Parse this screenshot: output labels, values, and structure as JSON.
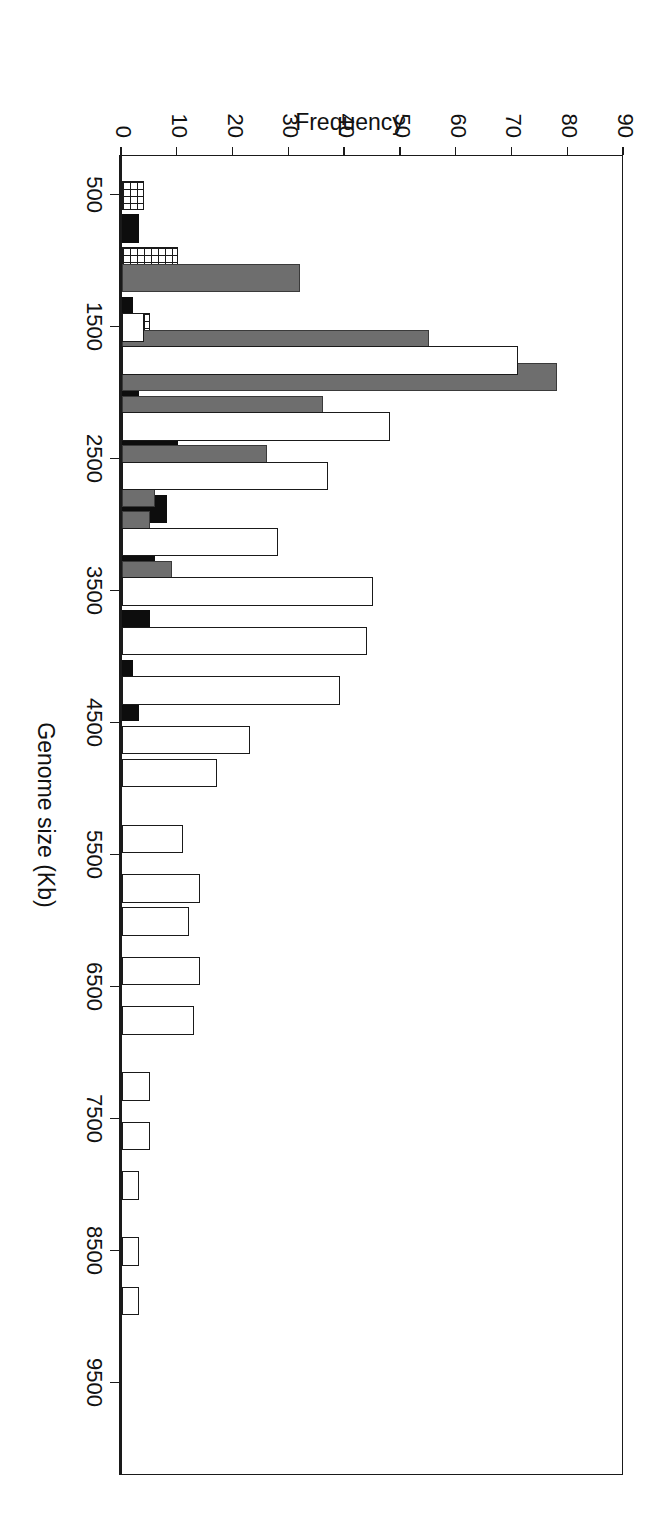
{
  "figure": {
    "background": "#ffffff",
    "frame_color": "#1a1a1a",
    "rotation_note": "page-rotated-90-degrees"
  },
  "chart_data": {
    "type": "bar",
    "title": "",
    "subtitle": "",
    "orientation": "vertical-grouped-histogram-rendered-rotated",
    "xlabel": "Genome size (Kb)",
    "ylabel": "Frequency",
    "xlim": [
      200,
      10200
    ],
    "ylim": [
      0,
      90
    ],
    "ytick_values": [
      0,
      10,
      20,
      30,
      40,
      50,
      60,
      70,
      80,
      90
    ],
    "ytick_labels": [
      "0",
      "10",
      "20",
      "30",
      "40",
      "50",
      "60",
      "70",
      "80",
      "90"
    ],
    "xtick_values": [
      500,
      1500,
      2500,
      3500,
      4500,
      5500,
      6500,
      7500,
      8500,
      9500
    ],
    "xtick_labels": [
      "500",
      "1500",
      "2500",
      "3500",
      "4500",
      "5500",
      "6500",
      "7500",
      "8500",
      "9500"
    ],
    "grid": false,
    "legend": false,
    "legend_position": "none",
    "bin_width": 250,
    "series_order": [
      "hatch",
      "black",
      "gray",
      "open"
    ],
    "series": [
      {
        "name": "crosshatch",
        "fill": "crosshatch",
        "color": "#ffffff",
        "edge": "#1a1a1a",
        "points": [
          {
            "x": 500,
            "y": 4
          },
          {
            "x": 1000,
            "y": 10
          },
          {
            "x": 1500,
            "y": 5
          },
          {
            "x": 1875,
            "y": 2
          }
        ]
      },
      {
        "name": "black",
        "fill": "solid",
        "color": "#0d0d0d",
        "edge": "#0d0d0d",
        "points": [
          {
            "x": 750,
            "y": 3
          },
          {
            "x": 1375,
            "y": 2
          },
          {
            "x": 2000,
            "y": 3
          },
          {
            "x": 2375,
            "y": 10
          },
          {
            "x": 2625,
            "y": 5
          },
          {
            "x": 2875,
            "y": 8
          },
          {
            "x": 3250,
            "y": 6
          },
          {
            "x": 3750,
            "y": 5
          },
          {
            "x": 4125,
            "y": 2
          },
          {
            "x": 4375,
            "y": 3
          }
        ]
      },
      {
        "name": "gray",
        "fill": "solid",
        "color": "#6e6e6e",
        "edge": "#3a3a3a",
        "points": [
          {
            "x": 1125,
            "y": 32
          },
          {
            "x": 1625,
            "y": 55
          },
          {
            "x": 1875,
            "y": 78
          },
          {
            "x": 2125,
            "y": 36
          },
          {
            "x": 2500,
            "y": 26
          },
          {
            "x": 2750,
            "y": 6
          },
          {
            "x": 3000,
            "y": 5
          },
          {
            "x": 3375,
            "y": 9
          },
          {
            "x": 3875,
            "y": 5
          },
          {
            "x": 4250,
            "y": 6
          },
          {
            "x": 4625,
            "y": 7
          },
          {
            "x": 4875,
            "y": 3
          }
        ]
      },
      {
        "name": "open",
        "fill": "none",
        "color": "#ffffff",
        "edge": "#1a1a1a",
        "points": [
          {
            "x": 1500,
            "y": 4
          },
          {
            "x": 1750,
            "y": 71
          },
          {
            "x": 2250,
            "y": 48
          },
          {
            "x": 2625,
            "y": 37
          },
          {
            "x": 3125,
            "y": 28
          },
          {
            "x": 3500,
            "y": 45
          },
          {
            "x": 3875,
            "y": 44
          },
          {
            "x": 4250,
            "y": 39
          },
          {
            "x": 4625,
            "y": 23
          },
          {
            "x": 4875,
            "y": 17
          },
          {
            "x": 5375,
            "y": 11
          },
          {
            "x": 5750,
            "y": 14
          },
          {
            "x": 6000,
            "y": 12
          },
          {
            "x": 6375,
            "y": 14
          },
          {
            "x": 6750,
            "y": 13
          },
          {
            "x": 7250,
            "y": 5
          },
          {
            "x": 7625,
            "y": 5
          },
          {
            "x": 8000,
            "y": 3
          },
          {
            "x": 8500,
            "y": 3
          },
          {
            "x": 8875,
            "y": 3
          }
        ]
      }
    ]
  }
}
